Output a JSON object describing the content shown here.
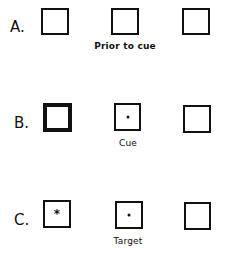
{
  "rows": [
    {
      "label": "A.",
      "caption": "Prior to cue",
      "boxes": [
        {
          "position": "left",
          "style": "normal",
          "marker": "none"
        },
        {
          "position": "center",
          "style": "normal",
          "marker": "none"
        },
        {
          "position": "right",
          "style": "normal",
          "marker": "none"
        }
      ]
    },
    {
      "label": "B.",
      "caption": "Cue",
      "boxes": [
        {
          "position": "left",
          "style": "thick",
          "marker": "none"
        },
        {
          "position": "center",
          "style": "normal",
          "marker": "dot"
        },
        {
          "position": "right",
          "style": "normal",
          "marker": "none"
        }
      ]
    },
    {
      "label": "C.",
      "caption": "Target",
      "boxes": [
        {
          "position": "left",
          "style": "normal",
          "marker": "asterisk"
        },
        {
          "position": "center",
          "style": "normal",
          "marker": "dot"
        },
        {
          "position": "right",
          "style": "normal",
          "marker": "none"
        }
      ]
    }
  ],
  "markers": {
    "asterisk": "*"
  }
}
